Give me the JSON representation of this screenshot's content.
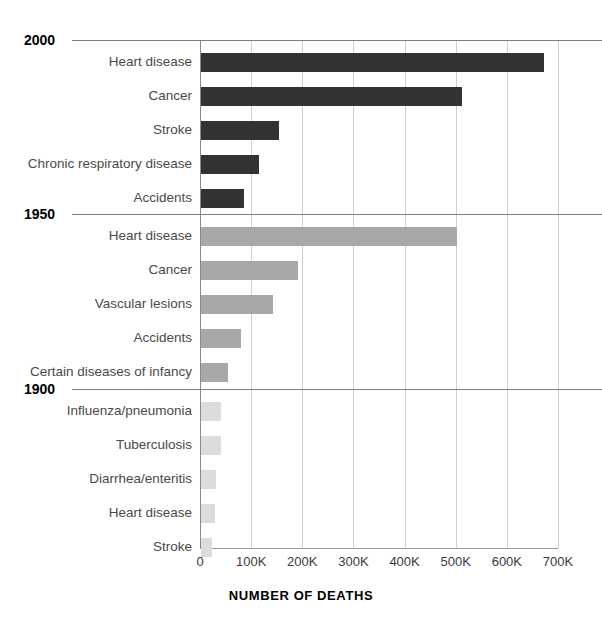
{
  "chart_data": {
    "type": "bar",
    "orientation": "horizontal",
    "title": "",
    "xlabel": "NUMBER OF DEATHS",
    "ylabel": "",
    "xlim": [
      0,
      700000
    ],
    "grid": true,
    "legend": "none",
    "tick_labels": [
      "0",
      "100K",
      "200K",
      "300K",
      "400K",
      "500K",
      "600K",
      "700K"
    ],
    "tick_values": [
      0,
      100000,
      200000,
      300000,
      400000,
      500000,
      600000,
      700000
    ],
    "groups": [
      {
        "year": "2000",
        "color": "#333333",
        "categories": [
          "Heart disease",
          "Cancer",
          "Stroke",
          "Chronic respiratory disease",
          "Accidents"
        ],
        "values": [
          670000,
          510000,
          153000,
          114000,
          84000
        ]
      },
      {
        "year": "1950",
        "color": "#a8a8a8",
        "categories": [
          "Heart disease",
          "Cancer",
          "Vascular lesions",
          "Accidents",
          "Certain diseases of infancy"
        ],
        "values": [
          500000,
          190000,
          141000,
          78000,
          53000
        ]
      },
      {
        "year": "1900",
        "color": "#dcdcdc",
        "categories": [
          "Influenza/pneumonia",
          "Tuberculosis",
          "Diarrhea/enteritis",
          "Heart disease",
          "Stroke"
        ],
        "values": [
          40000,
          39000,
          30000,
          28000,
          22000
        ]
      }
    ]
  }
}
